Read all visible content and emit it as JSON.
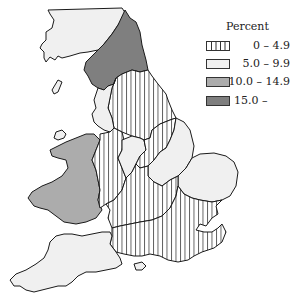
{
  "map": {
    "subject": "England and Wales by region",
    "classes": [
      {
        "key": "c1",
        "label": "0 – 4.9",
        "fill": "hatch",
        "pattern": "vertical-lines"
      },
      {
        "key": "c2",
        "label": "5.0 – 9.9",
        "fill": "#f0f0f0"
      },
      {
        "key": "c3",
        "label": "10.0 – 14.9",
        "fill": "#acacac"
      },
      {
        "key": "c4",
        "label": "15.0 –",
        "fill": "#7f7f7f"
      }
    ],
    "regions": [
      {
        "name": "scotland-border-north-west",
        "class": "c2"
      },
      {
        "name": "north",
        "class": "c4"
      },
      {
        "name": "yorkshire-humberside",
        "class": "c1"
      },
      {
        "name": "north-west",
        "class": "c2"
      },
      {
        "name": "wales",
        "class": "c3"
      },
      {
        "name": "west-midlands-west",
        "class": "c1"
      },
      {
        "name": "west-midlands-east",
        "class": "c2"
      },
      {
        "name": "east-midlands-west",
        "class": "c1"
      },
      {
        "name": "east-midlands-east",
        "class": "c2"
      },
      {
        "name": "east-anglia",
        "class": "c2"
      },
      {
        "name": "south-east",
        "class": "c1"
      },
      {
        "name": "south-central",
        "class": "c1"
      },
      {
        "name": "south-west",
        "class": "c2"
      },
      {
        "name": "isle-of-wight",
        "class": "c2"
      }
    ]
  },
  "legend": {
    "title": "Percent",
    "items": [
      {
        "label": "0 – 4.9"
      },
      {
        "label": "5.0 – 9.9"
      },
      {
        "label": "10.0 – 14.9"
      },
      {
        "label": "15.0 –"
      }
    ]
  },
  "colors": {
    "outline": "#1a1a1a",
    "light": "#f0f0f0",
    "medium": "#acacac",
    "dark": "#7f7f7f",
    "hatch_line": "#333333"
  }
}
